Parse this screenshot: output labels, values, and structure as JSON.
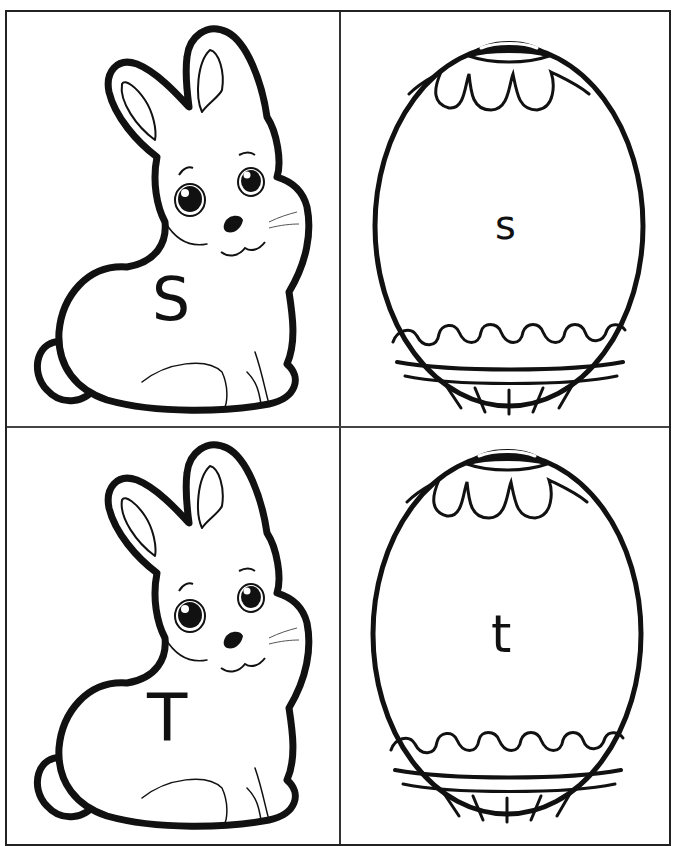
{
  "page": {
    "title_partial": "Matching Upper and Lowercase Letters (S-T)"
  },
  "cards": [
    {
      "type": "bunny",
      "letter": "S",
      "case": "uppercase",
      "position": "top-left"
    },
    {
      "type": "egg",
      "letter": "s",
      "case": "lowercase",
      "position": "top-right"
    },
    {
      "type": "bunny",
      "letter": "T",
      "case": "uppercase",
      "position": "bottom-left"
    },
    {
      "type": "egg",
      "letter": "t",
      "case": "lowercase",
      "position": "bottom-right"
    }
  ],
  "colors": {
    "ink": "#111111",
    "paper": "#ffffff",
    "grid": "#333333"
  }
}
